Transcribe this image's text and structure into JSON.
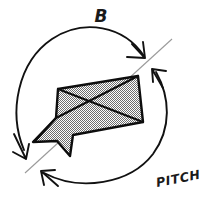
{
  "figure": {
    "background_color": "#ffffff",
    "ink_color": "#111111",
    "axis_color": "#9a9a9a",
    "fill_color": "#808080",
    "labels": {
      "top": "B",
      "bottom_right": "PITCH"
    },
    "icons": {
      "arc_top": "rotation-arc-top",
      "arc_bottom": "rotation-arc-bottom",
      "arrow_top_outer": "arrowhead-down-right",
      "arrow_top_inner": "arrowhead-up-left",
      "arrow_bottom_outer": "arrowhead-down-left",
      "arrow_bottom_inner": "arrowhead-up-left",
      "axis": "pitch-axis-line",
      "body": "hatched-aircraft-body",
      "cross": "body-diagonal-cross"
    },
    "geometry": {
      "circle_center": [
        92,
        101
      ],
      "circle_radius": 75,
      "axis_start": [
        170,
        41
      ],
      "axis_end": [
        26,
        172
      ],
      "body_vertices": [
        [
          58,
          89
        ],
        [
          138,
          76
        ],
        [
          143,
          122
        ],
        [
          73,
          135
        ],
        [
          70,
          156
        ],
        [
          57,
          141
        ],
        [
          33,
          142
        ],
        [
          56,
          118
        ]
      ],
      "cross_diagonals": [
        [
          [
            58,
            89
          ],
          [
            143,
            122
          ]
        ],
        [
          [
            138,
            76
          ],
          [
            56,
            118
          ]
        ]
      ]
    }
  }
}
